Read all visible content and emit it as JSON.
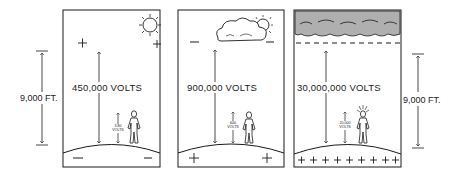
{
  "diagram": {
    "colors": {
      "ink": "#1a1a1a",
      "background": "#ffffff"
    },
    "dimensions": {
      "left": {
        "label": "9,000 FT."
      },
      "right": {
        "label": "9,000 FT."
      }
    },
    "panels": [
      {
        "id": "fair-weather",
        "sky_icon": "sun-icon",
        "sky_charges": [
          "+",
          "+"
        ],
        "ground_charges": [
          "−",
          "−"
        ],
        "atmosphere_voltage": "450,000 VOLTS",
        "person_voltage": {
          "value": "3-80",
          "unit": "VOLTS"
        }
      },
      {
        "id": "cloudy",
        "sky_icon": "cloud-sun-icon",
        "sky_charges": [
          "−",
          "−"
        ],
        "ground_charges": [
          "+",
          "+"
        ],
        "atmosphere_voltage": "900,000 VOLTS",
        "person_voltage": {
          "value": "600",
          "unit": "VOLTS"
        }
      },
      {
        "id": "thunderstorm",
        "sky_icon": "storm-cloud-icon",
        "sky_charges": [],
        "ground_charges": [
          "+",
          "+",
          "+",
          "+",
          "+",
          "+",
          "+",
          "+"
        ],
        "atmosphere_voltage": "30,000,000 VOLTS",
        "person_voltage": {
          "value": "20,000",
          "unit": "VOLTS"
        }
      }
    ]
  }
}
